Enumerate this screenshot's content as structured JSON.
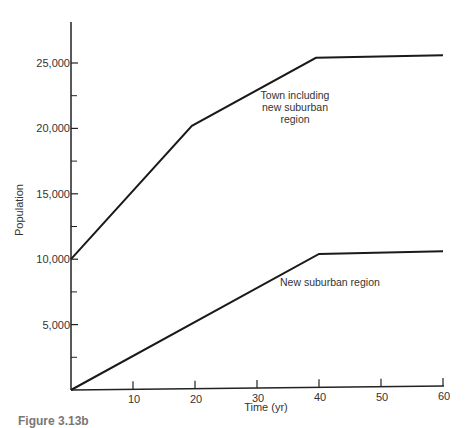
{
  "chart_data": {
    "type": "line",
    "title": "",
    "xlabel": "Time (yr)",
    "ylabel": "Population",
    "xlim": [
      0,
      60
    ],
    "ylim": [
      0,
      27500
    ],
    "x_ticks": [
      10,
      20,
      30,
      40,
      50,
      60
    ],
    "x_tick_labels": [
      "10",
      "20",
      "30",
      "40",
      "50",
      "60"
    ],
    "y_ticks": [
      5000,
      10000,
      15000,
      20000,
      25000
    ],
    "y_tick_labels": [
      "5,000",
      "10,000",
      "15,000",
      "20,000",
      "25,000"
    ],
    "y_minor_ticks": [
      2500,
      7500,
      12500,
      17500,
      22500
    ],
    "grid": false,
    "legend": "none (inline annotations)",
    "series": [
      {
        "name": "Town including new suburban region",
        "x": [
          0,
          19.5,
          39.5,
          60
        ],
        "y": [
          10000,
          20200,
          25400,
          25600
        ]
      },
      {
        "name": "New suburban region",
        "x": [
          0,
          40,
          60
        ],
        "y": [
          0,
          10400,
          10600
        ]
      }
    ],
    "annotations": [
      {
        "text_lines": [
          "Town including",
          "new suburban",
          "region"
        ],
        "x": 33,
        "y": 21500
      },
      {
        "text": "New suburban region",
        "x": 37,
        "y": 8000
      }
    ]
  },
  "caption": "Figure 3.13b"
}
